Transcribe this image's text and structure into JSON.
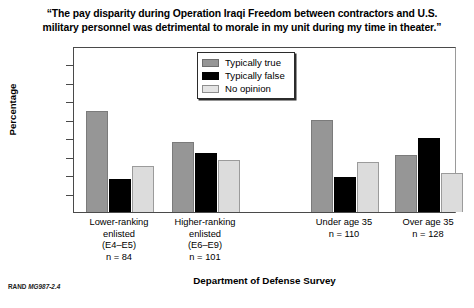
{
  "title": {
    "line1": "“The pay disparity during Operation Iraqi Freedom between contractors and U.S.",
    "line2": "military personnel was detrimental to morale in my unit during my time in theater.”"
  },
  "source_note": {
    "prefix": "RAND ",
    "id": "MG987-2.4"
  },
  "legend": {
    "items": [
      {
        "label": "Typically true",
        "color": "#969696",
        "key": "true"
      },
      {
        "label": "Typically false",
        "color": "#000000",
        "key": "false"
      },
      {
        "label": "No opinion",
        "color": "#dcdcdc",
        "key": "noop"
      }
    ]
  },
  "chart_data": {
    "type": "bar",
    "title": "“The pay disparity during Operation Iraqi Freedom between contractors and U.S. military personnel was detrimental to morale in my unit during my time in theater.”",
    "xlabel": "Department of Defense Survey",
    "ylabel": "Percentage",
    "ylim": [
      0,
      90
    ],
    "yticks": [
      0,
      10,
      20,
      30,
      40,
      50,
      60,
      70,
      80,
      90
    ],
    "grid": false,
    "legend_position": "top-center",
    "categories": [
      "Lower-ranking enlisted (E4–E5) n = 84",
      "Higher-ranking enlisted (E6–E9) n = 101",
      "Under age 35 n = 110",
      "Over age 35 n = 128"
    ],
    "category_labels": [
      {
        "lines": [
          "Lower-ranking",
          "enlisted",
          "(E4–E5)",
          "n = 84"
        ]
      },
      {
        "lines": [
          "Higher-ranking",
          "enlisted",
          "(E6–E9)",
          "n = 101"
        ]
      },
      {
        "lines": [
          "Under age 35",
          "n = 110"
        ]
      },
      {
        "lines": [
          "Over age 35",
          "n = 128"
        ]
      }
    ],
    "series": [
      {
        "name": "Typically true",
        "color": "#969696",
        "values": [
          55,
          38,
          50,
          31
        ]
      },
      {
        "name": "Typically false",
        "color": "#000000",
        "values": [
          18,
          32,
          19,
          40
        ]
      },
      {
        "name": "No opinion",
        "color": "#dcdcdc",
        "values": [
          25,
          28,
          27,
          21
        ]
      }
    ]
  }
}
